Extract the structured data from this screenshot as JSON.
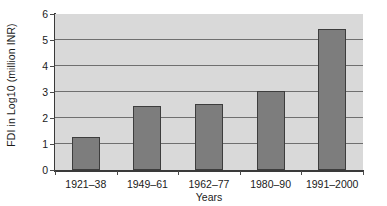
{
  "chart_data": {
    "type": "bar",
    "title": "",
    "subtitle": "",
    "xlabel": "Years",
    "ylabel": "FDI in Log10 (million INR)",
    "categories": [
      "1921–38",
      "1949–61",
      "1962–77",
      "1980–90",
      "1991–2000"
    ],
    "values": [
      1.26,
      2.45,
      2.54,
      3.05,
      5.43
    ],
    "series": [
      {
        "name": "FDI in Log10 (million INR)",
        "values": [
          1.26,
          2.45,
          2.54,
          3.05,
          5.43
        ]
      }
    ],
    "ylim": [
      0,
      6
    ],
    "yticks": [
      0,
      1,
      2,
      3,
      4,
      5,
      6
    ],
    "ytick_labels": [
      "0",
      "1",
      "2",
      "3",
      "4",
      "5",
      "6"
    ],
    "grid": true,
    "grid_axis": "y",
    "legend": false,
    "legend_position": "none",
    "annotations": [],
    "colors": {
      "bar_fill": "#7d7d7d",
      "bar_border": "#3d3d3d",
      "plot_background": "#d9d9d9",
      "figure_background": "#ffffff",
      "gridline": "#6f6f6f",
      "axis_line": "#3a3a3a",
      "text": "#1a1a1a"
    }
  }
}
